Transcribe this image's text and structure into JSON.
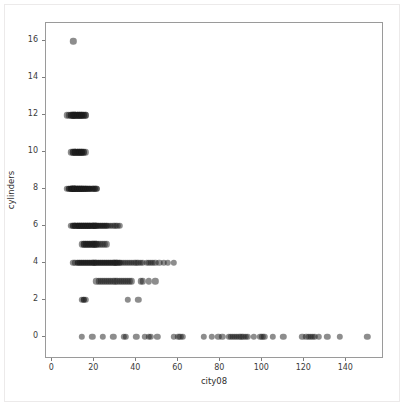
{
  "figure": {
    "background_color": "#ffffff",
    "axes_border_color": "#9a9a9a",
    "point_color": "#1c1c1c"
  },
  "chart_data": {
    "type": "scatter",
    "title": "",
    "xlabel": "city08",
    "ylabel": "cylinders",
    "xlim": [
      -3,
      157
    ],
    "ylim": [
      -1.1,
      17.0
    ],
    "xticks": [
      0,
      20,
      40,
      60,
      80,
      100,
      120,
      140
    ],
    "xticklabels": [
      "0",
      "20",
      "40",
      "60",
      "80",
      "100",
      "120",
      "140"
    ],
    "yticks": [
      0,
      2,
      4,
      6,
      8,
      10,
      12,
      14,
      16
    ],
    "yticklabels": [
      "0",
      "2",
      "4",
      "6",
      "8",
      "10",
      "12",
      "14",
      "16"
    ],
    "grid": false,
    "legend": null,
    "marker": "circle",
    "marker_size": 3.2,
    "marker_alpha": 0.5,
    "series": [
      {
        "name": "vehicles",
        "points": [
          [
            10,
            16
          ],
          [
            7,
            12
          ],
          [
            8,
            12
          ],
          [
            9,
            12
          ],
          [
            9,
            12
          ],
          [
            10,
            12
          ],
          [
            10,
            12
          ],
          [
            10,
            12
          ],
          [
            11,
            12
          ],
          [
            11,
            12
          ],
          [
            11,
            12
          ],
          [
            12,
            12
          ],
          [
            12,
            12
          ],
          [
            12,
            12
          ],
          [
            13,
            12
          ],
          [
            13,
            12
          ],
          [
            13,
            12
          ],
          [
            14,
            12
          ],
          [
            14,
            12
          ],
          [
            14,
            12
          ],
          [
            15,
            12
          ],
          [
            15,
            12
          ],
          [
            16,
            12
          ],
          [
            16,
            12
          ],
          [
            9,
            10
          ],
          [
            10,
            10
          ],
          [
            10,
            10
          ],
          [
            11,
            10
          ],
          [
            11,
            10
          ],
          [
            11,
            10
          ],
          [
            12,
            10
          ],
          [
            12,
            10
          ],
          [
            12,
            10
          ],
          [
            13,
            10
          ],
          [
            13,
            10
          ],
          [
            13,
            10
          ],
          [
            14,
            10
          ],
          [
            14,
            10
          ],
          [
            14,
            10
          ],
          [
            15,
            10
          ],
          [
            15,
            10
          ],
          [
            16,
            10
          ],
          [
            7,
            8
          ],
          [
            8,
            8
          ],
          [
            8,
            8
          ],
          [
            9,
            8
          ],
          [
            9,
            8
          ],
          [
            9,
            8
          ],
          [
            9,
            8
          ],
          [
            10,
            8
          ],
          [
            10,
            8
          ],
          [
            10,
            8
          ],
          [
            10,
            8
          ],
          [
            10,
            8
          ],
          [
            11,
            8
          ],
          [
            11,
            8
          ],
          [
            11,
            8
          ],
          [
            11,
            8
          ],
          [
            11,
            8
          ],
          [
            12,
            8
          ],
          [
            12,
            8
          ],
          [
            12,
            8
          ],
          [
            12,
            8
          ],
          [
            12,
            8
          ],
          [
            13,
            8
          ],
          [
            13,
            8
          ],
          [
            13,
            8
          ],
          [
            13,
            8
          ],
          [
            13,
            8
          ],
          [
            14,
            8
          ],
          [
            14,
            8
          ],
          [
            14,
            8
          ],
          [
            14,
            8
          ],
          [
            14,
            8
          ],
          [
            15,
            8
          ],
          [
            15,
            8
          ],
          [
            15,
            8
          ],
          [
            15,
            8
          ],
          [
            16,
            8
          ],
          [
            16,
            8
          ],
          [
            16,
            8
          ],
          [
            16,
            8
          ],
          [
            17,
            8
          ],
          [
            17,
            8
          ],
          [
            17,
            8
          ],
          [
            18,
            8
          ],
          [
            18,
            8
          ],
          [
            18,
            8
          ],
          [
            19,
            8
          ],
          [
            19,
            8
          ],
          [
            20,
            8
          ],
          [
            20,
            8
          ],
          [
            21,
            8
          ],
          [
            21,
            8
          ],
          [
            9,
            6
          ],
          [
            10,
            6
          ],
          [
            10,
            6
          ],
          [
            11,
            6
          ],
          [
            11,
            6
          ],
          [
            11,
            6
          ],
          [
            12,
            6
          ],
          [
            12,
            6
          ],
          [
            12,
            6
          ],
          [
            12,
            6
          ],
          [
            13,
            6
          ],
          [
            13,
            6
          ],
          [
            13,
            6
          ],
          [
            13,
            6
          ],
          [
            14,
            6
          ],
          [
            14,
            6
          ],
          [
            14,
            6
          ],
          [
            14,
            6
          ],
          [
            15,
            6
          ],
          [
            15,
            6
          ],
          [
            15,
            6
          ],
          [
            15,
            6
          ],
          [
            16,
            6
          ],
          [
            16,
            6
          ],
          [
            16,
            6
          ],
          [
            16,
            6
          ],
          [
            17,
            6
          ],
          [
            17,
            6
          ],
          [
            17,
            6
          ],
          [
            17,
            6
          ],
          [
            18,
            6
          ],
          [
            18,
            6
          ],
          [
            18,
            6
          ],
          [
            18,
            6
          ],
          [
            19,
            6
          ],
          [
            19,
            6
          ],
          [
            19,
            6
          ],
          [
            20,
            6
          ],
          [
            20,
            6
          ],
          [
            20,
            6
          ],
          [
            21,
            6
          ],
          [
            21,
            6
          ],
          [
            21,
            6
          ],
          [
            22,
            6
          ],
          [
            22,
            6
          ],
          [
            23,
            6
          ],
          [
            23,
            6
          ],
          [
            24,
            6
          ],
          [
            24,
            6
          ],
          [
            25,
            6
          ],
          [
            25,
            6
          ],
          [
            26,
            6
          ],
          [
            26,
            6
          ],
          [
            27,
            6
          ],
          [
            28,
            6
          ],
          [
            29,
            6
          ],
          [
            30,
            6
          ],
          [
            31,
            6
          ],
          [
            32,
            6
          ],
          [
            14,
            5
          ],
          [
            15,
            5
          ],
          [
            15,
            5
          ],
          [
            16,
            5
          ],
          [
            16,
            5
          ],
          [
            17,
            5
          ],
          [
            17,
            5
          ],
          [
            18,
            5
          ],
          [
            18,
            5
          ],
          [
            19,
            5
          ],
          [
            19,
            5
          ],
          [
            20,
            5
          ],
          [
            20,
            5
          ],
          [
            21,
            5
          ],
          [
            21,
            5
          ],
          [
            22,
            5
          ],
          [
            23,
            5
          ],
          [
            24,
            5
          ],
          [
            25,
            5
          ],
          [
            26,
            5
          ],
          [
            10,
            4
          ],
          [
            11,
            4
          ],
          [
            12,
            4
          ],
          [
            12,
            4
          ],
          [
            13,
            4
          ],
          [
            13,
            4
          ],
          [
            14,
            4
          ],
          [
            14,
            4
          ],
          [
            15,
            4
          ],
          [
            15,
            4
          ],
          [
            16,
            4
          ],
          [
            16,
            4
          ],
          [
            17,
            4
          ],
          [
            17,
            4
          ],
          [
            18,
            4
          ],
          [
            18,
            4
          ],
          [
            19,
            4
          ],
          [
            19,
            4
          ],
          [
            20,
            4
          ],
          [
            20,
            4
          ],
          [
            21,
            4
          ],
          [
            21,
            4
          ],
          [
            22,
            4
          ],
          [
            22,
            4
          ],
          [
            23,
            4
          ],
          [
            23,
            4
          ],
          [
            24,
            4
          ],
          [
            24,
            4
          ],
          [
            25,
            4
          ],
          [
            25,
            4
          ],
          [
            26,
            4
          ],
          [
            26,
            4
          ],
          [
            27,
            4
          ],
          [
            27,
            4
          ],
          [
            28,
            4
          ],
          [
            28,
            4
          ],
          [
            29,
            4
          ],
          [
            29,
            4
          ],
          [
            30,
            4
          ],
          [
            30,
            4
          ],
          [
            31,
            4
          ],
          [
            31,
            4
          ],
          [
            32,
            4
          ],
          [
            32,
            4
          ],
          [
            33,
            4
          ],
          [
            34,
            4
          ],
          [
            35,
            4
          ],
          [
            36,
            4
          ],
          [
            37,
            4
          ],
          [
            38,
            4
          ],
          [
            39,
            4
          ],
          [
            40,
            4
          ],
          [
            41,
            4
          ],
          [
            42,
            4
          ],
          [
            43,
            4
          ],
          [
            45,
            4
          ],
          [
            46,
            4
          ],
          [
            47,
            4
          ],
          [
            48,
            4
          ],
          [
            49,
            4
          ],
          [
            51,
            4
          ],
          [
            53,
            4
          ],
          [
            55,
            4
          ],
          [
            58,
            4
          ],
          [
            21,
            3
          ],
          [
            22,
            3
          ],
          [
            23,
            3
          ],
          [
            24,
            3
          ],
          [
            25,
            3
          ],
          [
            26,
            3
          ],
          [
            27,
            3
          ],
          [
            28,
            3
          ],
          [
            29,
            3
          ],
          [
            30,
            3
          ],
          [
            31,
            3
          ],
          [
            32,
            3
          ],
          [
            33,
            3
          ],
          [
            34,
            3
          ],
          [
            35,
            3
          ],
          [
            36,
            3
          ],
          [
            37,
            3
          ],
          [
            38,
            3
          ],
          [
            42,
            3
          ],
          [
            43,
            3
          ],
          [
            46,
            3
          ],
          [
            49,
            3
          ],
          [
            14,
            2
          ],
          [
            15,
            2
          ],
          [
            15,
            2
          ],
          [
            16,
            2
          ],
          [
            36,
            2
          ],
          [
            41,
            2
          ],
          [
            14,
            0
          ],
          [
            19,
            0
          ],
          [
            24,
            0
          ],
          [
            29,
            0
          ],
          [
            34,
            0
          ],
          [
            35,
            0
          ],
          [
            40,
            0
          ],
          [
            44,
            0
          ],
          [
            46,
            0
          ],
          [
            47,
            0
          ],
          [
            50,
            0
          ],
          [
            58,
            0
          ],
          [
            60,
            0
          ],
          [
            61,
            0
          ],
          [
            62,
            0
          ],
          [
            72,
            0
          ],
          [
            76,
            0
          ],
          [
            79,
            0
          ],
          [
            81,
            0
          ],
          [
            84,
            0
          ],
          [
            85,
            0
          ],
          [
            86,
            0
          ],
          [
            87,
            0
          ],
          [
            88,
            0
          ],
          [
            89,
            0
          ],
          [
            90,
            0
          ],
          [
            91,
            0
          ],
          [
            92,
            0
          ],
          [
            93,
            0
          ],
          [
            96,
            0
          ],
          [
            99,
            0
          ],
          [
            100,
            0
          ],
          [
            101,
            0
          ],
          [
            105,
            0
          ],
          [
            110,
            0
          ],
          [
            119,
            0
          ],
          [
            121,
            0
          ],
          [
            122,
            0
          ],
          [
            123,
            0
          ],
          [
            124,
            0
          ],
          [
            125,
            0
          ],
          [
            127,
            0
          ],
          [
            131,
            0
          ],
          [
            137,
            0
          ],
          [
            150,
            0
          ]
        ]
      }
    ]
  }
}
